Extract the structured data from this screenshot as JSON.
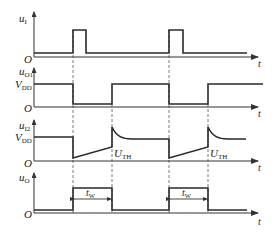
{
  "diagram": {
    "type": "timing-diagram",
    "colors": {
      "line": "#2a2a2a",
      "axis": "#333333",
      "dash": "#555555",
      "background": "#ffffff"
    },
    "time_axis_label": "t",
    "origin_label": "O",
    "panels": [
      {
        "id": "ui",
        "label_main": "u",
        "label_sub": "I",
        "levels": []
      },
      {
        "id": "uo1",
        "label_main": "u",
        "label_sub": "O1",
        "levels": [
          {
            "main": "V",
            "sub": "DD"
          }
        ]
      },
      {
        "id": "uc2",
        "label_main": "u",
        "label_sub": "I2",
        "levels": [
          {
            "main": "V",
            "sub": "DD"
          }
        ],
        "annotations": [
          {
            "main": "U",
            "sub": "TH"
          },
          {
            "main": "U",
            "sub": "TH"
          }
        ]
      },
      {
        "id": "uo",
        "label_main": "u",
        "label_sub": "O",
        "levels": [],
        "annotations": [
          {
            "main": "t",
            "sub": "W"
          },
          {
            "main": "t",
            "sub": "W"
          }
        ]
      }
    ]
  }
}
